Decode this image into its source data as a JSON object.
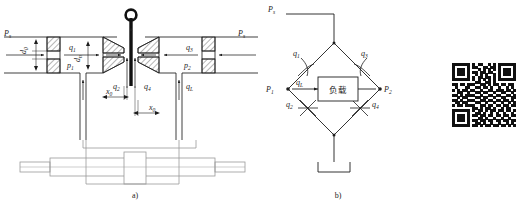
{
  "figure": {
    "title": "",
    "panels": [
      {
        "id": "a",
        "caption": "a)",
        "name": "nozzle-flapper-valve-cross-section",
        "labels": {
          "supply_left": "P",
          "supply_left_sub": "s",
          "supply_right": "P",
          "supply_right_sub": "s",
          "orifice_dia": "d",
          "orifice_dia_sub": "0",
          "nozzle_dia": "d",
          "nozzle_dia_sub": "n",
          "q1": "q",
          "q1_sub": "1",
          "q2": "q",
          "q2_sub": "2",
          "q3": "q",
          "q3_sub": "3",
          "q4": "q",
          "q4_sub": "4",
          "qL": "q",
          "qL_sub": "L",
          "p1": "p",
          "p1_sub": "1",
          "p2": "p",
          "p2_sub": "2",
          "x0_left": "x",
          "x0_left_sub": "0",
          "x0_right": "x",
          "x0_right_sub": "0"
        }
      },
      {
        "id": "b",
        "caption": "b)",
        "name": "hydraulic-wheatstone-bridge",
        "labels": {
          "supply": "P",
          "supply_sub": "s",
          "p1": "P",
          "p1_sub": "1",
          "p2": "P",
          "p2_sub": "2",
          "q1": "q",
          "q1_sub": "1",
          "q2": "q",
          "q2_sub": "2",
          "q3": "q",
          "q3_sub": "3",
          "q4": "q",
          "q4_sub": "4",
          "qL": "q",
          "qL_sub": "L",
          "load_box": "负载"
        }
      }
    ],
    "qr_code": {
      "name": "qr-code",
      "alt": "QR code",
      "modules": 25,
      "grid": [
        "1111111010110010101111111",
        "1000001011001101101000001",
        "1011101000101010101011101",
        "1011101011011011001011101",
        "1011101001010100101011101",
        "1000001010110110101000001",
        "1111111010101010101111111",
        "0000000001100110100000000",
        "1101101110011010110110110",
        "0100011001101101001001010",
        "1010110110010011011101101",
        "0011001001101100100110010",
        "1101011110010011011001101",
        "0010110001101100100110011",
        "1101001110011011011011010",
        "0110110001100100100100101",
        "1011011110011011011011011",
        "0000000011010110100101100",
        "1111111010110101101101101",
        "1000001001101001010010010",
        "1011101011011011011011011",
        "1011101000110100100100100",
        "1011101011011011011011011",
        "1000001001101001001001010",
        "1111111011010110110110101"
      ]
    },
    "colors": {
      "line": "#1d1d1d",
      "hatch": "#2a2a2a",
      "faint": "#9a9a9a",
      "flapper": "#111111",
      "background": "#ffffff"
    }
  }
}
